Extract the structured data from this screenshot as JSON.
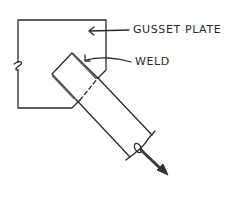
{
  "diagram": {
    "labels": {
      "gusset_plate": "GUSSET PLATE",
      "weld": "WELD"
    },
    "colors": {
      "ink": "#2a2a2a",
      "weld_shading": "#555555",
      "background": "#ffffff"
    },
    "icons": {
      "force_arrow": "arrow-down-right",
      "break_symbol": "break-line"
    }
  }
}
